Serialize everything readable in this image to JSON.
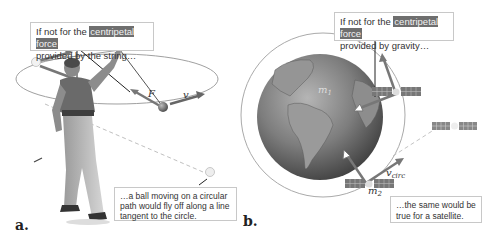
{
  "panel_a": {
    "label": "a.",
    "callout_top": {
      "prefix": "If not for the ",
      "highlight": "centripetal force",
      "line2": "provided by the string…"
    },
    "callout_bottom": {
      "line1": "…a ball moving on a circular",
      "line2": "path would fly off along a line",
      "line3": "tangent to the circle."
    },
    "symbols": {
      "force": "F",
      "velocity": "v"
    }
  },
  "panel_b": {
    "label": "b.",
    "callout_top": {
      "prefix": "If not for the ",
      "highlight": "centripetal force",
      "line2": "provided by gravity…"
    },
    "callout_bottom": {
      "line1": "…the same would be",
      "line2": "true for a satellite."
    },
    "symbols": {
      "m1": "m",
      "m1_sub": "1",
      "m2": "m",
      "m2_sub": "2",
      "vcirc": "v",
      "vcirc_sub": "circ"
    }
  },
  "colors": {
    "highlight_bg": "#6e6e6e",
    "arrow": "#6a6a6a",
    "orbit": "#a8a8a8",
    "earth": "#7a7a7a"
  }
}
